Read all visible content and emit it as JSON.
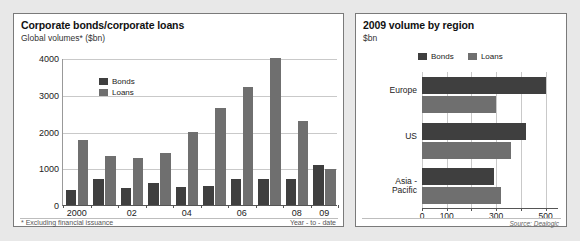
{
  "left_chart": {
    "title": "Corporate bonds/corporate loans",
    "subtitle": "Global volumes* ($bn)",
    "footnote": "* Excluding financial issuance",
    "note_right": "Year - to - date",
    "legend": {
      "bonds": "Bonds",
      "loans": "Loans"
    }
  },
  "right_chart": {
    "title": "2009 volume by region",
    "subtitle": "$bn",
    "source": "Source: Dealogic",
    "legend": {
      "bonds": "Bonds",
      "loans": "Loans"
    }
  },
  "colors": {
    "bonds": "#3f3f3f",
    "loans": "#6f6f6f",
    "grid": "#c9c9c9",
    "axis": "#555555",
    "panel_border": "#7a7a7a",
    "background": "#e8e8e8"
  },
  "chart_data": [
    {
      "type": "bar",
      "title": "Corporate bonds/corporate loans",
      "subtitle": "Global volumes* ($bn)",
      "xlabel": "",
      "ylabel": "$bn",
      "ylim": [
        0,
        4000
      ],
      "yticks": [
        0,
        1000,
        2000,
        3000,
        4000
      ],
      "ytick_labels": [
        "0",
        "1000",
        "2000",
        "3000",
        "4000"
      ],
      "grid": true,
      "legend_position": "inside-top-left",
      "categories": [
        "2000",
        "01",
        "02",
        "03",
        "04",
        "05",
        "06",
        "07",
        "08",
        "09"
      ],
      "xtick_labels": [
        "2000",
        "",
        "02",
        "",
        "04",
        "",
        "06",
        "",
        "08",
        "09"
      ],
      "series": [
        {
          "name": "Bonds",
          "values": [
            420,
            700,
            460,
            590,
            500,
            520,
            700,
            710,
            700,
            1090
          ]
        },
        {
          "name": "Loans",
          "values": [
            1760,
            1340,
            1270,
            1420,
            1980,
            2640,
            3210,
            4010,
            2290,
            990
          ]
        }
      ]
    },
    {
      "type": "bar",
      "orientation": "horizontal",
      "title": "2009 volume by region",
      "subtitle": "$bn",
      "xlabel": "$bn",
      "ylabel": "",
      "xlim": [
        0,
        550
      ],
      "xticks": [
        0,
        100,
        200,
        300,
        400,
        500
      ],
      "xtick_labels": [
        "0",
        "100",
        "",
        "300",
        "",
        "500"
      ],
      "grid": true,
      "legend_position": "above-plot",
      "categories": [
        "Europe",
        "US",
        "Asia-Pacific"
      ],
      "series": [
        {
          "name": "Bonds",
          "values": [
            500,
            420,
            290
          ]
        },
        {
          "name": "Loans",
          "values": [
            300,
            360,
            320
          ]
        }
      ],
      "source": "Source: Dealogic"
    }
  ]
}
